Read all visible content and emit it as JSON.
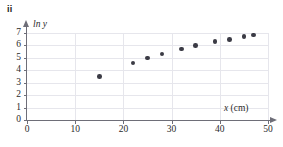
{
  "panel": {
    "label": "ii"
  },
  "chart_data": {
    "type": "scatter",
    "title": "",
    "xlabel": "x (cm)",
    "ylabel": "ln y",
    "xlim": [
      0,
      50
    ],
    "ylim": [
      0,
      7
    ],
    "grid": true,
    "legend": "none",
    "x_ticks": [
      0,
      10,
      20,
      30,
      40,
      50
    ],
    "y_ticks": [
      0,
      1,
      2,
      3,
      4,
      5,
      6,
      7
    ],
    "x_tick_labels": [
      "0",
      "10",
      "20",
      "30",
      "40",
      "50"
    ],
    "y_tick_labels": [
      "0",
      "1",
      "2",
      "3",
      "4",
      "5",
      "6",
      "7"
    ],
    "x": [
      15,
      22,
      25,
      28,
      32,
      35,
      39,
      42,
      45,
      47
    ],
    "y": [
      3.5,
      4.6,
      5.0,
      5.3,
      5.7,
      6.0,
      6.3,
      6.5,
      6.7,
      6.85
    ],
    "points": [
      {
        "x": 15,
        "y": 3.5
      },
      {
        "x": 22,
        "y": 4.6
      },
      {
        "x": 25,
        "y": 5.0
      },
      {
        "x": 28,
        "y": 5.3
      },
      {
        "x": 32,
        "y": 5.7
      },
      {
        "x": 35,
        "y": 6.0
      },
      {
        "x": 39,
        "y": 6.3
      },
      {
        "x": 42,
        "y": 6.5
      },
      {
        "x": 45,
        "y": 6.7
      },
      {
        "x": 47,
        "y": 6.85
      }
    ],
    "marker_color": "#3b3b45",
    "grid_color": "#e6e6ec",
    "axis_color": "#6e6e78"
  },
  "axis_title_parts": {
    "y_variable": "ln y",
    "x_variable": "x",
    "x_unit": "(cm)"
  }
}
